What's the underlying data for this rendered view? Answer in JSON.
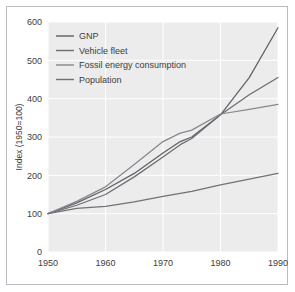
{
  "chart_data": {
    "type": "line",
    "title": "",
    "subtitle": "",
    "xlabel": "",
    "ylabel": "Index (1950=100)",
    "xlim": [
      1950,
      1990
    ],
    "ylim": [
      0,
      600
    ],
    "xticks": [
      1950,
      1960,
      1970,
      1980,
      1990
    ],
    "xtick_labels": [
      "1950",
      "1960",
      "1970",
      "1980",
      "1990"
    ],
    "yticks": [
      0,
      100,
      200,
      300,
      400,
      500,
      600
    ],
    "ytick_labels": [
      "0",
      "100",
      "200",
      "300",
      "400",
      "500",
      "600"
    ],
    "grid": true,
    "grid_color": "#ffffff",
    "plot_background": "#ececec",
    "legend_position": "upper-left-inside",
    "x": [
      1950,
      1955,
      1960,
      1965,
      1970,
      1973,
      1975,
      1980,
      1985,
      1990
    ],
    "series": [
      {
        "name": "GNP",
        "color": "#5f6166",
        "values": [
          100,
          128,
          163,
          205,
          258,
          288,
          300,
          358,
          455,
          585
        ]
      },
      {
        "name": "Vehicle fleet",
        "color": "#6b6d72",
        "values": [
          100,
          122,
          150,
          196,
          248,
          280,
          296,
          358,
          410,
          455
        ]
      },
      {
        "name": "Fossil energy consumption",
        "color": "#86888d",
        "values": [
          100,
          132,
          170,
          228,
          288,
          310,
          318,
          360,
          372,
          385
        ]
      },
      {
        "name": "Population",
        "color": "#707277",
        "values": [
          100,
          114,
          119,
          131,
          145,
          153,
          158,
          175,
          190,
          205
        ]
      }
    ]
  },
  "legend": {
    "items": [
      {
        "label": "GNP"
      },
      {
        "label": "Vehicle fleet"
      },
      {
        "label": "Fossil energy consumption"
      },
      {
        "label": "Population"
      }
    ]
  }
}
